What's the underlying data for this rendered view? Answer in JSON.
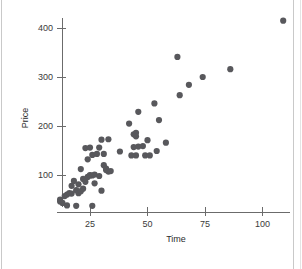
{
  "chart_data": {
    "type": "scatter",
    "title": "",
    "xlabel": "Time",
    "ylabel": "Price",
    "xlim": [
      8,
      115
    ],
    "ylim": [
      25,
      430
    ],
    "xticks": [
      25,
      50,
      75,
      100
    ],
    "yticks": [
      100,
      200,
      300,
      400
    ],
    "grid": false,
    "legend": null,
    "marker": {
      "shape": "circle",
      "color": "#58585c",
      "size": 3.1
    },
    "points": [
      {
        "x": 12,
        "y": 46
      },
      {
        "x": 12,
        "y": 50
      },
      {
        "x": 13,
        "y": 43
      },
      {
        "x": 14,
        "y": 57
      },
      {
        "x": 15,
        "y": 60
      },
      {
        "x": 15,
        "y": 38
      },
      {
        "x": 16,
        "y": 63
      },
      {
        "x": 17,
        "y": 62
      },
      {
        "x": 17,
        "y": 78
      },
      {
        "x": 18,
        "y": 88
      },
      {
        "x": 19,
        "y": 69
      },
      {
        "x": 19,
        "y": 37
      },
      {
        "x": 20,
        "y": 81
      },
      {
        "x": 20,
        "y": 63
      },
      {
        "x": 21,
        "y": 67
      },
      {
        "x": 21,
        "y": 112
      },
      {
        "x": 22,
        "y": 92
      },
      {
        "x": 22,
        "y": 72
      },
      {
        "x": 23,
        "y": 155
      },
      {
        "x": 23,
        "y": 86
      },
      {
        "x": 24,
        "y": 132
      },
      {
        "x": 24,
        "y": 96
      },
      {
        "x": 25,
        "y": 156
      },
      {
        "x": 25,
        "y": 99
      },
      {
        "x": 25,
        "y": 100
      },
      {
        "x": 26,
        "y": 141
      },
      {
        "x": 26,
        "y": 99
      },
      {
        "x": 26,
        "y": 37
      },
      {
        "x": 27,
        "y": 101
      },
      {
        "x": 27,
        "y": 83
      },
      {
        "x": 28,
        "y": 143
      },
      {
        "x": 29,
        "y": 156
      },
      {
        "x": 29,
        "y": 98
      },
      {
        "x": 30,
        "y": 172
      },
      {
        "x": 30,
        "y": 68
      },
      {
        "x": 31,
        "y": 143
      },
      {
        "x": 31,
        "y": 120
      },
      {
        "x": 32,
        "y": 110
      },
      {
        "x": 32,
        "y": 113
      },
      {
        "x": 33,
        "y": 173
      },
      {
        "x": 33,
        "y": 107
      },
      {
        "x": 34,
        "y": 108
      },
      {
        "x": 38,
        "y": 148
      },
      {
        "x": 42,
        "y": 205
      },
      {
        "x": 43,
        "y": 140
      },
      {
        "x": 44,
        "y": 157
      },
      {
        "x": 44,
        "y": 183
      },
      {
        "x": 45,
        "y": 186
      },
      {
        "x": 45,
        "y": 179
      },
      {
        "x": 45,
        "y": 140
      },
      {
        "x": 46,
        "y": 229
      },
      {
        "x": 46,
        "y": 158
      },
      {
        "x": 48,
        "y": 159
      },
      {
        "x": 49,
        "y": 140
      },
      {
        "x": 50,
        "y": 171
      },
      {
        "x": 51,
        "y": 140
      },
      {
        "x": 53,
        "y": 246
      },
      {
        "x": 54,
        "y": 149
      },
      {
        "x": 55,
        "y": 212
      },
      {
        "x": 58,
        "y": 166
      },
      {
        "x": 63,
        "y": 341
      },
      {
        "x": 64,
        "y": 263
      },
      {
        "x": 68,
        "y": 284
      },
      {
        "x": 74,
        "y": 300
      },
      {
        "x": 86,
        "y": 316
      },
      {
        "x": 109,
        "y": 415
      }
    ]
  },
  "figure": {
    "background_color": "#ffffff",
    "border_color": "#c9c9c9",
    "axis_color": "#6b6b6b",
    "point_color": "#58585c"
  }
}
